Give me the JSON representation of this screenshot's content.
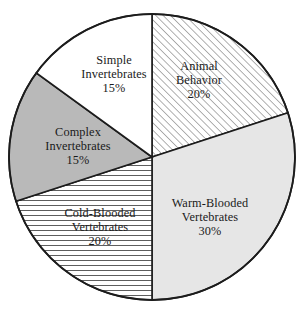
{
  "chart_data": {
    "type": "pie",
    "title": "",
    "subtitle": "",
    "xlabel": "",
    "ylabel": "",
    "legend_position": "none",
    "grid": false,
    "start_angle_deg": 0,
    "direction": "clockwise",
    "total_percent": 100,
    "categories": [
      "Animal Behavior",
      "Warm-Blooded Vertebrates",
      "Cold-Blooded Vertebrates",
      "Complex Invertebrates",
      "Simple Invertebrates"
    ],
    "values": [
      20,
      30,
      20,
      15,
      15
    ],
    "slices": [
      {
        "id": "animal-behavior",
        "name": "Animal Behavior",
        "label_lines": [
          "Animal",
          "Behavior"
        ],
        "percent_text": "20%",
        "value": 20,
        "fill_style": "diagonal-hatch",
        "fill_color": "#ffffff",
        "hatch_color": "#6b6b6b",
        "start_pct": 0,
        "end_pct": 20,
        "label_x": 199,
        "label_y": 81
      },
      {
        "id": "warm-blooded-vertebrates",
        "name": "Warm-Blooded Vertebrates",
        "label_lines": [
          "Warm-Blooded",
          "Vertebrates"
        ],
        "percent_text": "30%",
        "value": 30,
        "fill_style": "solid",
        "fill_color": "#e6e6e6",
        "hatch_color": "",
        "start_pct": 20,
        "end_pct": 50,
        "label_x": 210,
        "label_y": 218
      },
      {
        "id": "cold-blooded-vertebrates",
        "name": "Cold-Blooded Vertebrates",
        "label_lines": [
          "Cold-Blooded",
          "Vertebrates"
        ],
        "percent_text": "20%",
        "value": 20,
        "fill_style": "horizontal-hatch",
        "fill_color": "#ffffff",
        "hatch_color": "#5e5e5e",
        "start_pct": 50,
        "end_pct": 70,
        "label_x": 100,
        "label_y": 228
      },
      {
        "id": "complex-invertebrates",
        "name": "Complex Invertebrates",
        "label_lines": [
          "Complex",
          "Invertebrates"
        ],
        "percent_text": "15%",
        "value": 15,
        "fill_style": "solid",
        "fill_color": "#b9b9b9",
        "hatch_color": "",
        "start_pct": 70,
        "end_pct": 85,
        "label_x": 78,
        "label_y": 147
      },
      {
        "id": "simple-invertebrates",
        "name": "Simple Invertebrates",
        "label_lines": [
          "Simple",
          "Invertebrates"
        ],
        "percent_text": "15%",
        "value": 15,
        "fill_style": "solid",
        "fill_color": "#ffffff",
        "hatch_color": "",
        "start_pct": 85,
        "end_pct": 100,
        "label_x": 114,
        "label_y": 75
      }
    ],
    "geometry": {
      "center_x": 152,
      "center_y": 157,
      "radius": 143
    },
    "colors": {
      "outline": "#1c1c1c",
      "background": "#ffffff",
      "text": "#1a1a1a"
    }
  }
}
